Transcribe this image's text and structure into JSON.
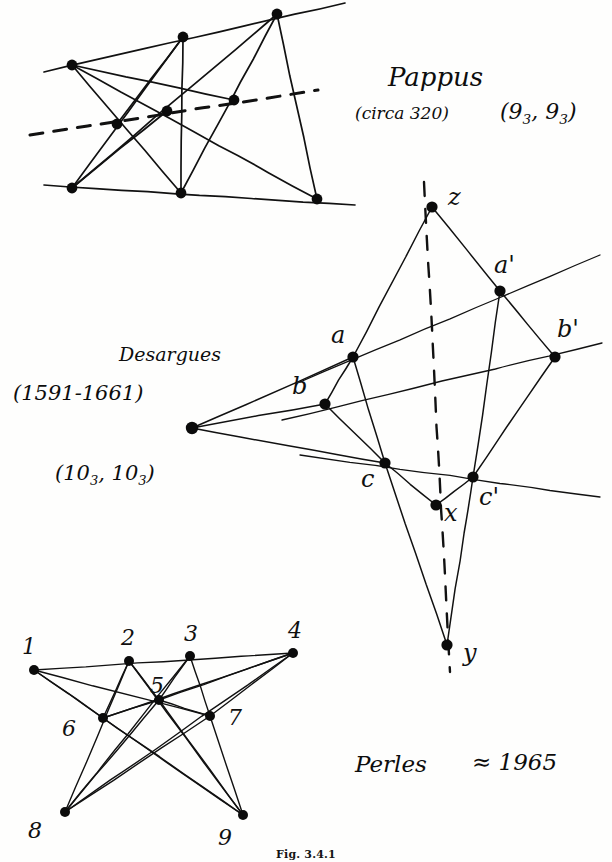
{
  "figure": {
    "caption": "Fig. 3.4.1",
    "ink_color": "#111111",
    "point_color": "#0b0b0b",
    "background": "#fefefd"
  },
  "pappus": {
    "name": "Pappus",
    "date": "(circa 320)",
    "notation_prefix": "(9",
    "notation_sub1": "3",
    "notation_mid": ", 9",
    "notation_sub2": "3",
    "notation_suffix": ")",
    "points": [
      {
        "id": "p1",
        "x": 72,
        "y": 65
      },
      {
        "id": "p2",
        "x": 183,
        "y": 37
      },
      {
        "id": "p3",
        "x": 277,
        "y": 14
      },
      {
        "id": "p4",
        "x": 117,
        "y": 124
      },
      {
        "id": "p5",
        "x": 167,
        "y": 111
      },
      {
        "id": "p6",
        "x": 234,
        "y": 100
      },
      {
        "id": "p7",
        "x": 72,
        "y": 188
      },
      {
        "id": "p8",
        "x": 181,
        "y": 193
      },
      {
        "id": "p9",
        "x": 317,
        "y": 199
      }
    ],
    "solid_lines": [
      {
        "from": [
          44,
          72
        ],
        "to": [
          345,
          3
        ]
      },
      {
        "from": [
          44,
          185
        ],
        "to": [
          355,
          205
        ]
      },
      {
        "from": [
          72,
          65
        ],
        "to": [
          181,
          193
        ]
      },
      {
        "from": [
          72,
          65
        ],
        "to": [
          317,
          199
        ]
      },
      {
        "from": [
          183,
          37
        ],
        "to": [
          72,
          188
        ]
      },
      {
        "from": [
          183,
          37
        ],
        "to": [
          181,
          193
        ]
      },
      {
        "from": [
          277,
          14
        ],
        "to": [
          72,
          188
        ]
      },
      {
        "from": [
          277,
          14
        ],
        "to": [
          181,
          193
        ]
      },
      {
        "from": [
          277,
          14
        ],
        "to": [
          317,
          199
        ]
      },
      {
        "from": [
          72,
          65
        ],
        "to": [
          234,
          100
        ]
      },
      {
        "from": [
          183,
          37
        ],
        "to": [
          117,
          124
        ]
      },
      {
        "from": [
          72,
          188
        ],
        "to": [
          167,
          111
        ]
      }
    ],
    "dashed_line": {
      "from": [
        30,
        135
      ],
      "to": [
        318,
        90
      ]
    }
  },
  "desargues": {
    "name": "Desargues",
    "date": "(1591-1661)",
    "notation_prefix": "(10",
    "notation_sub1": "3",
    "notation_mid": ", 10",
    "notation_sub2": "3",
    "notation_suffix": ")",
    "points": [
      {
        "id": "o",
        "label": "",
        "x": 192,
        "y": 428
      },
      {
        "id": "z",
        "label": "z",
        "x": 432,
        "y": 207
      },
      {
        "id": "a",
        "label": "a",
        "x": 353,
        "y": 357
      },
      {
        "id": "ap",
        "label": "a'",
        "x": 500,
        "y": 291
      },
      {
        "id": "b",
        "label": "b",
        "x": 325,
        "y": 404
      },
      {
        "id": "bp",
        "label": "b'",
        "x": 555,
        "y": 357
      },
      {
        "id": "c",
        "label": "c",
        "x": 385,
        "y": 463
      },
      {
        "id": "cp",
        "label": "c'",
        "x": 473,
        "y": 477
      },
      {
        "id": "x",
        "label": "x",
        "x": 436,
        "y": 505
      },
      {
        "id": "y",
        "label": "y",
        "x": 447,
        "y": 645
      }
    ],
    "solid_lines": [
      {
        "from": [
          432,
          207
        ],
        "to": [
          353,
          357
        ]
      },
      {
        "from": [
          432,
          207
        ],
        "to": [
          500,
          291
        ]
      },
      {
        "from": [
          353,
          357
        ],
        "to": [
          325,
          404
        ]
      },
      {
        "from": [
          500,
          291
        ],
        "to": [
          555,
          357
        ]
      },
      {
        "from": [
          353,
          357
        ],
        "to": [
          385,
          463
        ]
      },
      {
        "from": [
          325,
          404
        ],
        "to": [
          385,
          463
        ]
      },
      {
        "from": [
          500,
          291
        ],
        "to": [
          473,
          477
        ]
      },
      {
        "from": [
          555,
          357
        ],
        "to": [
          473,
          477
        ]
      },
      {
        "from": [
          385,
          463
        ],
        "to": [
          436,
          505
        ]
      },
      {
        "from": [
          473,
          477
        ],
        "to": [
          436,
          505
        ]
      },
      {
        "from": [
          385,
          463
        ],
        "to": [
          447,
          645
        ]
      },
      {
        "from": [
          473,
          477
        ],
        "to": [
          447,
          645
        ]
      },
      {
        "from": [
          192,
          428
        ],
        "to": [
          353,
          357
        ]
      },
      {
        "from": [
          192,
          428
        ],
        "to": [
          325,
          404
        ]
      },
      {
        "from": [
          192,
          428
        ],
        "to": [
          385,
          463
        ]
      }
    ],
    "transversal_lines": [
      {
        "from": [
          300,
          382
        ],
        "to": [
          600,
          255
        ]
      },
      {
        "from": [
          282,
          420
        ],
        "to": [
          602,
          343
        ]
      },
      {
        "from": [
          300,
          455
        ],
        "to": [
          600,
          497
        ]
      }
    ],
    "dashed_axis": {
      "from": [
        424,
        182
      ],
      "to": [
        450,
        672
      ]
    }
  },
  "perles": {
    "name": "Perles",
    "date": "≈ 1965",
    "points": [
      {
        "label": "1",
        "x": 34,
        "y": 670,
        "lx": 22,
        "ly": 636
      },
      {
        "label": "2",
        "x": 129,
        "y": 661,
        "lx": 121,
        "ly": 627
      },
      {
        "label": "3",
        "x": 190,
        "y": 656,
        "lx": 184,
        "ly": 623
      },
      {
        "label": "4",
        "x": 293,
        "y": 653,
        "lx": 288,
        "ly": 620
      },
      {
        "label": "5",
        "x": 159,
        "y": 700,
        "lx": 150,
        "ly": 675
      },
      {
        "label": "6",
        "x": 103,
        "y": 718,
        "lx": 62,
        "ly": 718
      },
      {
        "label": "7",
        "x": 210,
        "y": 716,
        "lx": 228,
        "ly": 707
      },
      {
        "label": "8",
        "x": 65,
        "y": 812,
        "lx": 28,
        "ly": 820
      },
      {
        "label": "9",
        "x": 243,
        "y": 815,
        "lx": 218,
        "ly": 827
      }
    ],
    "lines": [
      {
        "from": [
          34,
          670
        ],
        "to": [
          293,
          653
        ]
      },
      {
        "from": [
          34,
          670
        ],
        "to": [
          210,
          716
        ]
      },
      {
        "from": [
          34,
          670
        ],
        "to": [
          243,
          815
        ]
      },
      {
        "from": [
          34,
          670
        ],
        "to": [
          103,
          718
        ]
      },
      {
        "from": [
          129,
          661
        ],
        "to": [
          65,
          812
        ]
      },
      {
        "from": [
          129,
          661
        ],
        "to": [
          103,
          718
        ]
      },
      {
        "from": [
          129,
          661
        ],
        "to": [
          159,
          700
        ]
      },
      {
        "from": [
          129,
          661
        ],
        "to": [
          243,
          815
        ]
      },
      {
        "from": [
          190,
          656
        ],
        "to": [
          159,
          700
        ]
      },
      {
        "from": [
          190,
          656
        ],
        "to": [
          210,
          716
        ]
      },
      {
        "from": [
          190,
          656
        ],
        "to": [
          65,
          812
        ]
      },
      {
        "from": [
          293,
          653
        ],
        "to": [
          159,
          700
        ]
      },
      {
        "from": [
          293,
          653
        ],
        "to": [
          103,
          718
        ]
      },
      {
        "from": [
          293,
          653
        ],
        "to": [
          210,
          716
        ]
      },
      {
        "from": [
          293,
          653
        ],
        "to": [
          65,
          812
        ]
      },
      {
        "from": [
          159,
          700
        ],
        "to": [
          65,
          812
        ]
      },
      {
        "from": [
          159,
          700
        ],
        "to": [
          243,
          815
        ]
      },
      {
        "from": [
          159,
          700
        ],
        "to": [
          103,
          718
        ]
      },
      {
        "from": [
          159,
          700
        ],
        "to": [
          210,
          716
        ]
      },
      {
        "from": [
          103,
          718
        ],
        "to": [
          243,
          815
        ]
      },
      {
        "from": [
          210,
          716
        ],
        "to": [
          65,
          812
        ]
      },
      {
        "from": [
          210,
          716
        ],
        "to": [
          243,
          815
        ]
      }
    ]
  }
}
